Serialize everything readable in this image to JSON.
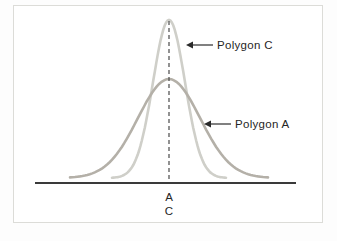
{
  "figure": {
    "background": "#ffffff",
    "border_color": "#dcdcd8",
    "text_color": "#262626"
  },
  "chart_data": {
    "type": "line",
    "title": "",
    "grid": false,
    "legend": "none",
    "series": [
      {
        "name": "Polygon C",
        "shape": "normal-curve",
        "relative_spread": "narrow",
        "color": "#cfcfc9",
        "stroke_width": 2.6,
        "mean_x": 169,
        "peak_y": 20,
        "baseline_y": 178,
        "sigma_px": 16,
        "x_min": 112,
        "x_max": 226
      },
      {
        "name": "Polygon A",
        "shape": "normal-curve",
        "relative_spread": "wide",
        "color": "#b4b0a8",
        "stroke_width": 2.6,
        "mean_x": 169,
        "peak_y": 79,
        "baseline_y": 178,
        "sigma_px": 31,
        "x_min": 70,
        "x_max": 268
      }
    ],
    "x_axis": {
      "y": 183,
      "x_start": 35,
      "x_end": 296,
      "color": "#3a3a3a",
      "stroke_width": 2
    },
    "mean_line": {
      "x": 169,
      "y_top": 21,
      "y_bottom": 183,
      "color": "#4a4a4a",
      "dash": "4 3",
      "stroke_width": 1.2
    },
    "annotations": [
      {
        "label": "Polygon C",
        "arrow_tip": [
          186,
          45
        ],
        "arrow_tail": [
          213,
          45
        ],
        "text_x": 217,
        "text_y": 45
      },
      {
        "label": "Polygon A",
        "arrow_tip": [
          204,
          124
        ],
        "arrow_tail": [
          231,
          124
        ],
        "text_x": 235,
        "text_y": 124
      }
    ],
    "axis_labels_below": [
      {
        "text": "A",
        "x": 169,
        "y": 197
      },
      {
        "text": "C",
        "x": 169,
        "y": 211
      }
    ],
    "annotation_color": "#2a2a2a"
  }
}
